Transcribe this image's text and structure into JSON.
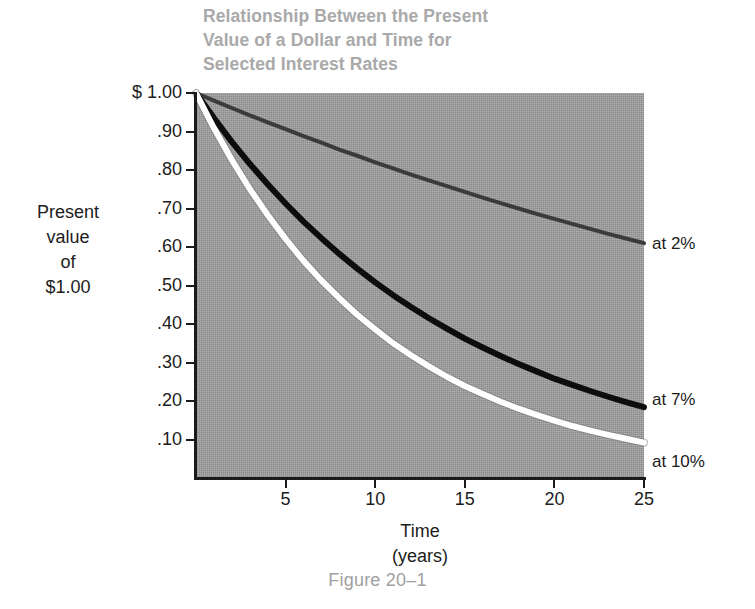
{
  "figure": {
    "title": "Relationship Between the Present\nValue of a Dollar and Time for\nSelected Interest Rates",
    "caption": "Figure 20–1",
    "y_axis_title": "Present\nvalue\nof\n$1.00",
    "x_axis_title": "Time\n(years)"
  },
  "series_labels": {
    "rate_2": "at 2%",
    "rate_7": "at 7%",
    "rate_10": "at 10%"
  },
  "chart_data": {
    "type": "line",
    "title": "Relationship Between the Present Value of a Dollar and Time for Selected Interest Rates",
    "subtitle": "",
    "caption": "Figure 20–1",
    "xlabel": "Time (years)",
    "ylabel": "Present value of $1.00",
    "xlim": [
      0,
      25
    ],
    "ylim": [
      0.0,
      1.0
    ],
    "grid": false,
    "legend_position": "right-of-curve-ends",
    "xticks": [
      5,
      10,
      15,
      20,
      25
    ],
    "xtick_labels": [
      "5",
      "10",
      "15",
      "20",
      "25"
    ],
    "yticks": [
      1.0,
      0.9,
      0.8,
      0.7,
      0.6,
      0.5,
      0.4,
      0.3,
      0.2,
      0.1
    ],
    "ytick_labels": [
      "$ 1.00",
      ".90",
      ".80",
      ".70",
      ".60",
      ".50",
      ".40",
      ".30",
      ".20",
      ".10"
    ],
    "plot_background_color": "#9b9b9b",
    "x": [
      0,
      1,
      2,
      3,
      4,
      5,
      6,
      7,
      8,
      9,
      10,
      11,
      12,
      13,
      14,
      15,
      16,
      17,
      18,
      19,
      20,
      21,
      22,
      23,
      24,
      25
    ],
    "series": [
      {
        "name": "at 2%",
        "rate": 0.02,
        "color": "#3b3b3b",
        "values": [
          1.0,
          0.98,
          0.961,
          0.942,
          0.924,
          0.906,
          0.888,
          0.871,
          0.853,
          0.837,
          0.82,
          0.804,
          0.788,
          0.773,
          0.758,
          0.743,
          0.728,
          0.714,
          0.7,
          0.686,
          0.673,
          0.66,
          0.647,
          0.634,
          0.622,
          0.61
        ]
      },
      {
        "name": "at 7%",
        "rate": 0.07,
        "color": "#0d0d0d",
        "values": [
          1.0,
          0.935,
          0.873,
          0.816,
          0.763,
          0.713,
          0.666,
          0.623,
          0.582,
          0.544,
          0.508,
          0.475,
          0.444,
          0.415,
          0.388,
          0.362,
          0.339,
          0.317,
          0.296,
          0.277,
          0.258,
          0.242,
          0.226,
          0.211,
          0.197,
          0.184
        ]
      },
      {
        "name": "at 10%",
        "rate": 0.1,
        "color": "#ffffff",
        "values": [
          1.0,
          0.909,
          0.826,
          0.751,
          0.683,
          0.621,
          0.564,
          0.513,
          0.467,
          0.424,
          0.386,
          0.35,
          0.319,
          0.29,
          0.263,
          0.239,
          0.218,
          0.198,
          0.18,
          0.164,
          0.149,
          0.135,
          0.123,
          0.112,
          0.102,
          0.092
        ]
      }
    ]
  }
}
